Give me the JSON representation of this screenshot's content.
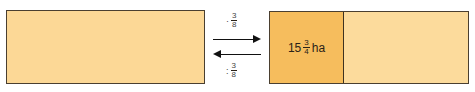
{
  "left_box": {
    "color": "#fcd896"
  },
  "right_box": {
    "shaded_part": {
      "color": "#f6bd5d",
      "whole": "15",
      "numerator": "3",
      "denominator": "4",
      "unit": "ha"
    },
    "rest_color": "#fcdb9c"
  },
  "operators": {
    "forward": {
      "symbol": "·",
      "numerator": "3",
      "denominator": "8",
      "direction": "right"
    },
    "backward": {
      "symbol": ":",
      "numerator": "3",
      "denominator": "8",
      "direction": "left"
    }
  }
}
